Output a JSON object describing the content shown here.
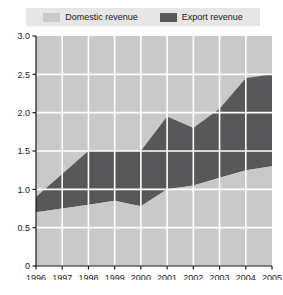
{
  "legend": {
    "entries": [
      {
        "label": "Domestic revenue",
        "color": "#c9c9c9",
        "icon": "legend-swatch-icon"
      },
      {
        "label": "Export revenue",
        "color": "#58585a",
        "icon": "legend-swatch-icon"
      }
    ]
  },
  "chart_data": {
    "type": "area",
    "stacked": true,
    "title": "",
    "xlabel": "",
    "ylabel": "",
    "categories": [
      "1996",
      "1997",
      "1998",
      "1999",
      "2000",
      "2001",
      "2002",
      "2003",
      "2004",
      "2005"
    ],
    "x": [
      1996,
      1997,
      1998,
      1999,
      2000,
      2001,
      2002,
      2003,
      2004,
      2005
    ],
    "series": [
      {
        "name": "Domestic revenue",
        "color": "#c9c9c9",
        "values": [
          0.7,
          0.75,
          0.8,
          0.85,
          0.78,
          1.0,
          1.05,
          1.15,
          1.25,
          1.3
        ]
      },
      {
        "name": "Export revenue",
        "color": "#58585a",
        "values": [
          0.2,
          0.45,
          0.7,
          0.65,
          0.72,
          0.95,
          0.75,
          0.9,
          1.2,
          1.2
        ]
      }
    ],
    "totals": [
      0.9,
      1.2,
      1.5,
      1.5,
      1.5,
      1.95,
      1.8,
      2.05,
      2.45,
      2.5
    ],
    "ylim": [
      0,
      3.0
    ],
    "ytick_values": [
      0,
      0.5,
      1.0,
      1.5,
      2.0,
      2.5,
      3.0
    ],
    "ytick_labels": [
      "0",
      "0.5",
      "1.0",
      "1.5",
      "2.0",
      "2.5",
      "3.0"
    ],
    "xtick_labels": [
      "1996",
      "1997",
      "1998",
      "1999",
      "2000",
      "2001",
      "2002",
      "2003",
      "2004",
      "2005"
    ],
    "grid": true,
    "grid_color": "#ffffff",
    "plot_background": "#c9c9c9",
    "legend_position": "top"
  }
}
